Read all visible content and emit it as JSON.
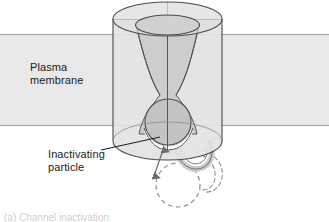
{
  "figure": {
    "width": 329,
    "height": 222,
    "background": "#ffffff"
  },
  "labels": {
    "plasma_membrane": "Plasma\nmembrane",
    "inactivating_particle": "Inactivating\nparticle",
    "caption_clipped": "(a) Channel inactivation"
  },
  "colors": {
    "membrane_fill": "#e9e9e9",
    "membrane_edge": "#9a9a9a",
    "channel_fill": "#e2e2e2",
    "channel_edge": "#4a4a4a",
    "pore_fill": "#cfcfcf",
    "particle_fill": "#c4c4c4",
    "particle_edge": "#555555",
    "dashed_stroke": "#8e8e8e",
    "text": "#1b1b1b",
    "leader_line": "#1b1b1b",
    "arrow": "#6e6e6e"
  },
  "shapes": {
    "membrane_band": {
      "top": 34,
      "bottom": 126
    },
    "channel_cylinder": {
      "left": 113,
      "right": 222,
      "top": 2,
      "bottom": 152
    },
    "pore_mouth": {
      "cx": 167,
      "cy": 25,
      "rx": 32,
      "ry": 10
    },
    "inactivating_particle_ball": {
      "cx": 168,
      "cy": 122,
      "r": 23
    },
    "displaced_particle_ball": {
      "cx": 178,
      "cy": 185,
      "r": 22
    }
  },
  "icons": {
    "double_arrow": "double-headed-arrow-icon",
    "leader": "leader-line-icon"
  }
}
